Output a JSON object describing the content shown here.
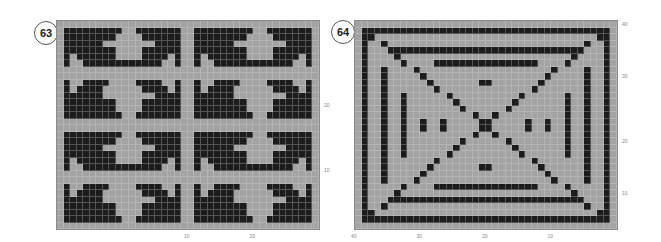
{
  "charts": [
    {
      "id": "63",
      "label": "63",
      "cols": 40,
      "rows": 32,
      "quadrant": [
        "....................",
        ".#########..#######.",
        ".########....######.",
        ".######........####.",
        ".########....######.",
        ".#.######....####.#.",
        ".#..############..#.",
        "....................",
        "....................",
        ".#..####....####..#.",
        ".#.####......####.#.",
        ".######........####.",
        ".########....######.",
        ".########....######.",
        ".#########..#######.",
        "...................."
      ],
      "y_ticks": [
        {
          "label": "20",
          "row": 12
        },
        {
          "label": "10",
          "row": 22
        }
      ],
      "x_ticks": [
        {
          "label": "10",
          "col": 20
        },
        {
          "label": "20",
          "col": 30
        }
      ]
    },
    {
      "id": "64",
      "label": "64",
      "cols": 40,
      "rows": 32,
      "y_ticks": [
        {
          "label": "40",
          "row": 0
        },
        {
          "label": "30",
          "row": 8
        },
        {
          "label": "20",
          "row": 18
        },
        {
          "label": "10",
          "row": 26
        }
      ],
      "x_ticks": [
        {
          "label": "40",
          "col": 0
        },
        {
          "label": "30",
          "col": 10
        },
        {
          "label": "20",
          "col": 20
        },
        {
          "label": "10",
          "col": 30
        }
      ]
    }
  ],
  "colors": {
    "on": "#1c1c1c",
    "off": "#a3a3a3",
    "border": "#8a8a8a"
  }
}
